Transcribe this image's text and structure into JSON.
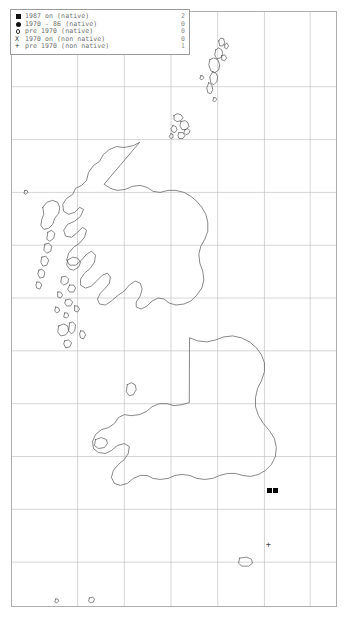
{
  "map": {
    "title": "UK and Ireland species distribution map",
    "region": "Great Britain and Ireland",
    "background_color": "#ffffff",
    "frame_color": "#aeaeae",
    "coastline_color": "#555555",
    "grid_color": "#b9b9b9"
  },
  "legend": {
    "border_color": "#9a9a9a",
    "text_color": "#6d6d6d",
    "rows": [
      {
        "symbol": "filled-square",
        "label": "1987 on (native)",
        "count": "2"
      },
      {
        "symbol": "filled-circle",
        "label": "1970 - 86 (native)",
        "count": "0"
      },
      {
        "symbol": "open-circle",
        "label": "pre 1970 (native)",
        "count": "0"
      },
      {
        "symbol": "cross-x",
        "label": "1970 on (non native)",
        "count": "0"
      },
      {
        "symbol": "plus",
        "label": "pre 1970 (non native)",
        "count": "1"
      }
    ]
  },
  "grid": {
    "vertical_x": [
      66,
      113,
      160,
      207,
      254,
      300
    ],
    "horizontal_y": [
      75,
      128,
      181,
      234,
      287,
      340,
      393,
      446,
      499,
      552
    ]
  },
  "markers": [
    {
      "symbol": "filled-square",
      "class": "1987 on (native)",
      "x": 255,
      "y": 476,
      "glyph": ""
    },
    {
      "symbol": "filled-square",
      "class": "1987 on (native)",
      "x": 261,
      "y": 476,
      "glyph": ""
    },
    {
      "symbol": "plus",
      "class": "pre 1970 (non native)",
      "x": 254,
      "y": 529,
      "glyph": "+"
    }
  ]
}
